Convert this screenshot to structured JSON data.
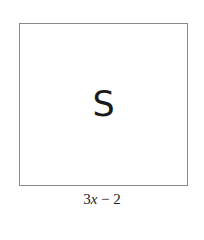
{
  "figure": {
    "shape": "square",
    "area_label": "S",
    "side_label": {
      "coefficient": "3",
      "variable": "x",
      "operator": " − ",
      "constant": "2",
      "full": "3x − 2"
    },
    "colors": {
      "border": "#8a8a8a",
      "text": "#1a1a1a",
      "background": "#ffffff"
    }
  }
}
